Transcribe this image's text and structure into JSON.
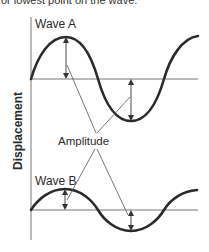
{
  "caption": "or lowest point on the wave.",
  "y_axis_label": "Displacement",
  "annotation_label": "Amplitude",
  "waves": [
    {
      "label": "Wave A",
      "amplitude": "large"
    },
    {
      "label": "Wave B",
      "amplitude": "small"
    }
  ],
  "colors": {
    "wave": "#2b2b2b",
    "axis": "#777777",
    "leader": "#555555"
  }
}
